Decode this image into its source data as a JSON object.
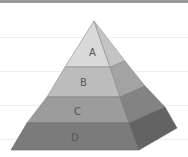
{
  "diagram": {
    "type": "pyramid",
    "levels": [
      {
        "label": "A",
        "front_color": "#d9d9d9",
        "side_color": "#c4c4c4"
      },
      {
        "label": "B",
        "front_color": "#bcbcbc",
        "side_color": "#a3a3a3"
      },
      {
        "label": "C",
        "front_color": "#9c9c9c",
        "side_color": "#838383"
      },
      {
        "label": "D",
        "front_color": "#7b7b7b",
        "side_color": "#636363"
      }
    ],
    "border_color": "#9a9a9a"
  }
}
